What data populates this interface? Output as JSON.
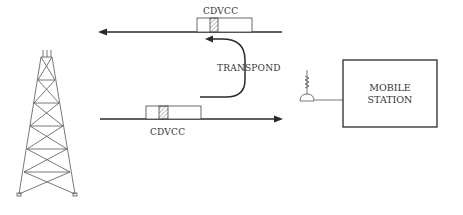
{
  "diagram": {
    "type": "communication-flow",
    "nodes": {
      "base_station": {
        "icon": "radio-tower-icon"
      },
      "mobile_station": {
        "line1": "MOBILE",
        "line2": "STATION",
        "icon": "antenna-icon"
      }
    },
    "signals": {
      "forward_channel": {
        "label": "CDVCC",
        "direction": "left"
      },
      "reverse_channel": {
        "label": "CDVCC",
        "direction": "right"
      },
      "transpond": {
        "label": "TRANSPOND"
      }
    }
  },
  "colors": {
    "line": "#2a2a2a",
    "thin": "#555555",
    "hatch": "#777777"
  }
}
